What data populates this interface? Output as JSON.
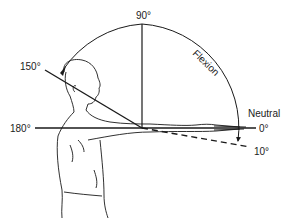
{
  "diagram": {
    "labels": {
      "deg90": "90°",
      "deg150": "150°",
      "deg180": "180°",
      "deg0": "0°",
      "deg10": "10°",
      "neutral": "Neutral",
      "flexion": "Flexion"
    },
    "colors": {
      "line": "#1a1a1a",
      "background": "#ffffff"
    }
  }
}
